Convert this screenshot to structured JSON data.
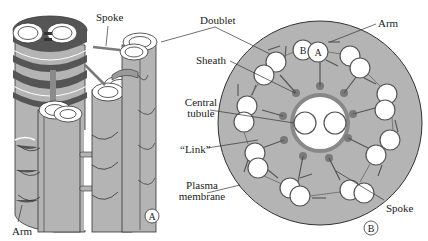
{
  "figure": {
    "colors": {
      "background": "#ffffff",
      "fill_gray": "#b4b4b4",
      "dark_gray": "#555555",
      "outline": "#333333",
      "tubule_fill": "#ffffff",
      "spoke_head": "#7a7a7a",
      "label_text": "#222222"
    }
  },
  "panel_a": {
    "marker": "A",
    "view": "3D longitudinal",
    "labels": {
      "spoke": "Spoke",
      "arm": "Arm"
    }
  },
  "panel_b": {
    "marker": "B",
    "view": "cross-section (9+2)",
    "labels": {
      "doublet": "Doublet",
      "arm": "Arm",
      "sheath": "Sheath",
      "central_tubule_line1": "Central",
      "central_tubule_line2": "tubule",
      "link": "“Link”",
      "plasma_line1": "Plasma",
      "plasma_line2": "membrane",
      "spoke": "Spoke"
    },
    "tubule_letters": {
      "b": "B",
      "a": "A"
    },
    "doublet_count": 9,
    "central_pair_count": 2
  }
}
